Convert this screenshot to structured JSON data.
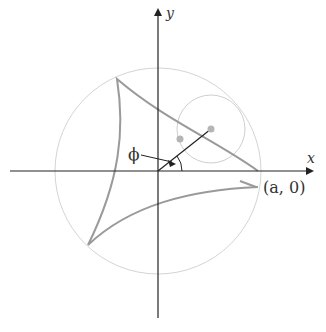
{
  "diagram": {
    "labels": {
      "x_axis": "x",
      "y_axis": "y",
      "angle": "ϕ",
      "cusp_point": "(a, 0)"
    },
    "colors": {
      "axes": "#222222",
      "curve": "#9a9a9a",
      "circle": "#cfcfcf",
      "dot": "#b5b5b5"
    }
  }
}
